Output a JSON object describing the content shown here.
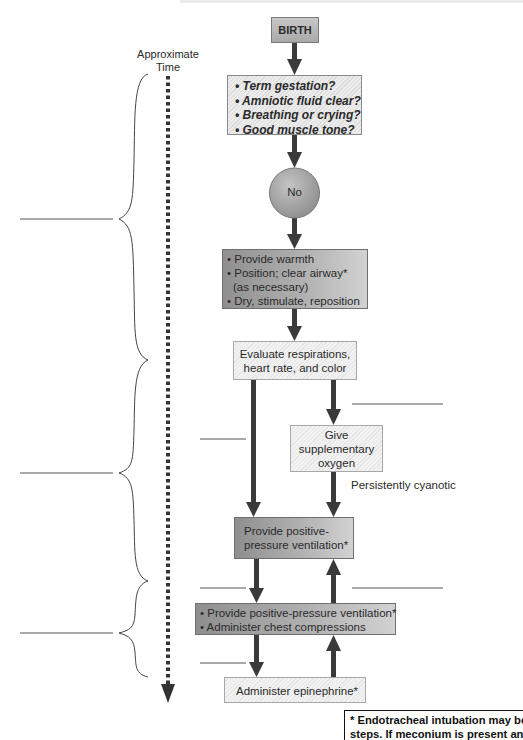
{
  "timeline": {
    "label_line1": "Approximate",
    "label_line2": "Time",
    "brackets": [
      {
        "range_y": [
          74,
          360
        ],
        "label": ""
      },
      {
        "range_y": [
          360,
          581
        ],
        "label": ""
      },
      {
        "range_y": [
          581,
          677
        ],
        "label": ""
      }
    ]
  },
  "nodes": {
    "birth": {
      "label": "BIRTH"
    },
    "questions": {
      "items": [
        "• Term gestation?",
        "• Amniotic fluid clear?",
        "• Breathing or crying?",
        "• Good muscle tone?"
      ]
    },
    "no": {
      "label": "No"
    },
    "initial_steps": {
      "items": [
        "• Provide warmth",
        "• Position; clear airway*",
        "  (as necessary)",
        "• Dry, stimulate, reposition"
      ]
    },
    "evaluate": {
      "line1": "Evaluate respirations,",
      "line2": "heart rate, and color"
    },
    "oxygen": {
      "line1": "Give",
      "line2": "supplementary",
      "line3": "oxygen"
    },
    "ppv": {
      "line1": "Provide positive-",
      "line2": "pressure ventilation*"
    },
    "ppv_compressions": {
      "items": [
        "• Provide positive-pressure ventilation*",
        "• Administer chest compressions"
      ]
    },
    "epinephrine": {
      "label": "Administer epinephrine*"
    }
  },
  "edge_labels": {
    "persistently_cyanotic": "Persistently cyanotic"
  },
  "blank_answer_lines": [
    {
      "side": "left",
      "y": 219
    },
    {
      "side": "right",
      "y": 404
    },
    {
      "side": "left",
      "y": 439
    },
    {
      "side": "left",
      "y": 473
    },
    {
      "side": "left",
      "y": 588
    },
    {
      "side": "right",
      "y": 588
    },
    {
      "side": "left",
      "y": 633
    },
    {
      "side": "left",
      "y": 663
    }
  ],
  "footnote": {
    "line1": "* Endotracheal intubation may be considered at several",
    "line2": "steps. If meconium is present and infant depressed,"
  },
  "colors": {
    "arrow": "#3a3a3a",
    "dark_box": "#9a9a9a",
    "circle": "#a6a6a6",
    "line": "#555555"
  }
}
